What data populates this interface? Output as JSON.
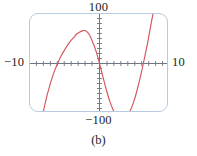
{
  "figure": {
    "caption": "(b)",
    "frame": {
      "border_color": "#b9cbe0",
      "background": "#ffffff"
    }
  },
  "chart_data": {
    "type": "line",
    "title": "",
    "subtitle": "",
    "xlabel": "",
    "ylabel": "",
    "xlim": [
      -10,
      10
    ],
    "ylim": [
      -100,
      100
    ],
    "grid": false,
    "legend": "none",
    "axis_color": "#6f7680",
    "curve_color": "#d4565c",
    "tick_marks": {
      "x_tick_count": 20,
      "y_tick_count": 20,
      "x_tick_spacing": 1,
      "y_tick_spacing": 10,
      "labeled_x_ticks": [
        -10,
        10
      ],
      "labeled_y_ticks": [
        -100,
        100
      ]
    },
    "tick_labels": {
      "x_min": "−10",
      "x_max": "10",
      "y_min": "−100",
      "y_max": "100"
    },
    "series": [
      {
        "name": "curve",
        "color": "#d4565c",
        "description": "steeply oscillating curve clipped by the viewport; rises off-screen at upper left, crosses zero near x = -3.4, plunges through the origin, reaches a minimum below y = -100 near x = 3.5, and rises back off-screen at the right",
        "x_intercepts": [
          -3.4,
          0,
          6.9
        ],
        "x": [
          -10,
          -9.5,
          -9,
          -8.5,
          -8,
          -7.5,
          -7,
          -6.5,
          -6,
          -5.5,
          -5,
          -4.5,
          -4,
          -3.5,
          -3.4,
          -3,
          -2.5,
          -2,
          -1.5,
          -1,
          -0.5,
          0,
          0.5,
          1,
          1.5,
          2,
          2.5,
          3,
          3.5,
          4,
          4.5,
          5,
          5.5,
          6,
          6.5,
          6.9,
          7.5,
          8,
          8.5,
          9,
          9.5,
          10
        ],
        "y": [
          -260,
          -210,
          -166,
          -126,
          -92,
          -62,
          -37,
          -16,
          1,
          16,
          28,
          39,
          48,
          56,
          58,
          62,
          66,
          66,
          59,
          44,
          25,
          0,
          -27,
          -54,
          -77,
          -95,
          -107,
          -113,
          -113,
          -106,
          -93,
          -74,
          -49,
          -20,
          13,
          40,
          86,
          120,
          152,
          182,
          208,
          230
        ]
      }
    ]
  }
}
